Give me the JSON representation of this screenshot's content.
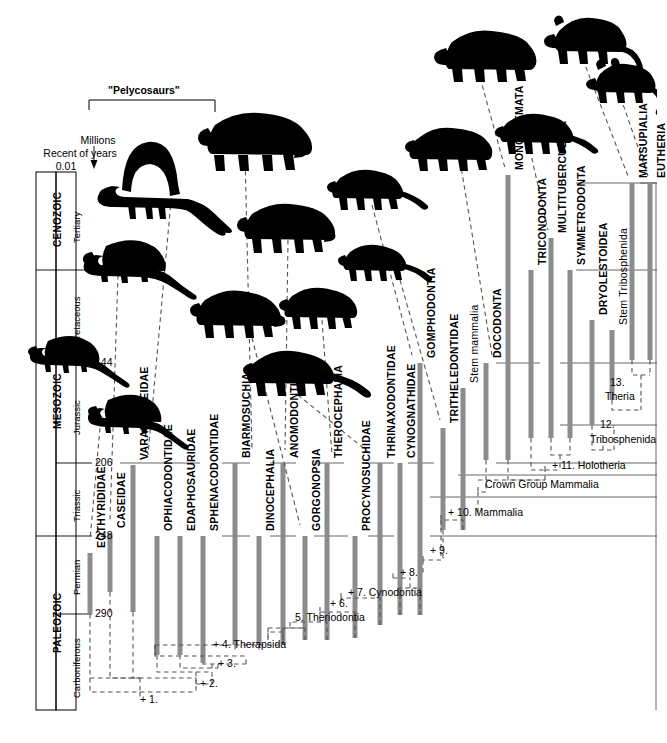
{
  "figure": {
    "title_overlay": "\"Pelycosaurs\"",
    "axis_caption_line1": "Millions",
    "axis_caption_line2": "of years",
    "recent_label": "Recent",
    "recent_value": "0.01"
  },
  "timescale": {
    "ticks": [
      {
        "value": "0.01",
        "y": 172
      },
      {
        "value": "65",
        "y": 270
      },
      {
        "value": "144",
        "y": 363
      },
      {
        "value": "206",
        "y": 463
      },
      {
        "value": "248",
        "y": 536
      },
      {
        "value": "290",
        "y": 614
      }
    ],
    "eras": [
      {
        "name": "CENOZOIC",
        "top": 172,
        "bottom": 270
      },
      {
        "name": "MESOZOIC",
        "top": 270,
        "bottom": 536
      },
      {
        "name": "PALEOZOIC",
        "top": 536,
        "bottom": 710
      }
    ],
    "periods": [
      {
        "name": "Tertiary",
        "top": 172,
        "bottom": 270
      },
      {
        "name": "Cretaceous",
        "top": 270,
        "bottom": 363
      },
      {
        "name": "Jurassic",
        "top": 363,
        "bottom": 463
      },
      {
        "name": "Triassic",
        "top": 463,
        "bottom": 536
      },
      {
        "name": "Permian",
        "top": 536,
        "bottom": 614
      },
      {
        "name": "Carboniferous",
        "top": 614,
        "bottom": 710
      }
    ]
  },
  "taxa": [
    {
      "label": "EOTHYRIDIDAE",
      "x": 90,
      "top": 553,
      "bottom": 614,
      "label_y": 548,
      "bold": true
    },
    {
      "label": "CASEIDAE",
      "x": 110,
      "top": 533,
      "bottom": 592,
      "label_y": 528,
      "bold": true
    },
    {
      "label": "VARANOPSEIDAE",
      "x": 133,
      "top": 465,
      "bottom": 612,
      "label_y": 460,
      "bold": true
    },
    {
      "label": "OPHIACODONTIDAE",
      "x": 157,
      "top": 536,
      "bottom": 655,
      "label_y": 531,
      "bold": true
    },
    {
      "label": "EDAPHOSAURIDAE",
      "x": 180,
      "top": 536,
      "bottom": 655,
      "label_y": 531,
      "bold": true
    },
    {
      "label": "SPHENACODONTIDAE",
      "x": 203,
      "top": 536,
      "bottom": 663,
      "label_y": 531,
      "bold": true
    },
    {
      "label": "BIARMOSUCHIA",
      "x": 235,
      "top": 463,
      "bottom": 645,
      "label_y": 458,
      "bold": true
    },
    {
      "label": "DINOCEPHALIA",
      "x": 259,
      "top": 536,
      "bottom": 645,
      "label_y": 531,
      "bold": true
    },
    {
      "label": "ANOMODONTIA",
      "x": 283,
      "top": 463,
      "bottom": 645,
      "label_y": 458,
      "bold": true
    },
    {
      "label": "GORGONOPSIA",
      "x": 305,
      "top": 536,
      "bottom": 640,
      "label_y": 531,
      "bold": true
    },
    {
      "label": "THEROCEPHALIA",
      "x": 327,
      "top": 463,
      "bottom": 640,
      "label_y": 458,
      "bold": true
    },
    {
      "label": "PROCYNOSUCHIDAE",
      "x": 355,
      "top": 536,
      "bottom": 638,
      "label_y": 531,
      "bold": true
    },
    {
      "label": "THRINAXODONTIDAE",
      "x": 380,
      "top": 463,
      "bottom": 625,
      "label_y": 458,
      "bold": true
    },
    {
      "label": "CYNOGNATHIDAE",
      "x": 400,
      "top": 463,
      "bottom": 615,
      "label_y": 458,
      "bold": true
    },
    {
      "label": "GOMPHODONTIA",
      "x": 420,
      "top": 363,
      "bottom": 615,
      "label_y": 358,
      "bold": true
    },
    {
      "label": "TRITHELEDONTIDAE",
      "x": 443,
      "top": 428,
      "bottom": 530,
      "label_y": 423,
      "bold": true
    },
    {
      "label": "Stem mammalia",
      "x": 463,
      "top": 388,
      "bottom": 530,
      "label_y": 383,
      "bold": false
    },
    {
      "label": "DOCODONTA",
      "x": 486,
      "top": 363,
      "bottom": 460,
      "label_y": 358,
      "bold": true
    },
    {
      "label": "MONOTREMATA",
      "x": 508,
      "top": 175,
      "bottom": 460,
      "label_y": 170,
      "bold": true
    },
    {
      "label": "TRICONODONTA",
      "x": 531,
      "top": 270,
      "bottom": 438,
      "label_y": 265,
      "bold": true
    },
    {
      "label": "MULTITUBERCULATA",
      "x": 551,
      "top": 238,
      "bottom": 438,
      "label_y": 233,
      "bold": true
    },
    {
      "label": "SYMMETRODONTA",
      "x": 570,
      "top": 270,
      "bottom": 438,
      "label_y": 265,
      "bold": true
    },
    {
      "label": "DRYOLESTOIDEA",
      "x": 592,
      "top": 320,
      "bottom": 425,
      "label_y": 315,
      "bold": true
    },
    {
      "label": "Stem Tribosphenida",
      "x": 612,
      "top": 330,
      "bottom": 400,
      "label_y": 325,
      "bold": false
    },
    {
      "label": "MARSUPIALIA",
      "x": 632,
      "top": 183,
      "bottom": 360,
      "label_y": 178,
      "bold": true
    },
    {
      "label": "EUTHERIA",
      "x": 650,
      "top": 183,
      "bottom": 360,
      "label_y": 178,
      "bold": true
    }
  ],
  "nodes": [
    {
      "label": "+ 1.",
      "x": 140,
      "y": 700
    },
    {
      "label": "+ 2.",
      "x": 200,
      "y": 684
    },
    {
      "label": "+ 3.",
      "x": 218,
      "y": 664
    },
    {
      "label": "+  4. Therapsida",
      "x": 213,
      "y": 645
    },
    {
      "label": "5. Theriodontia",
      "x": 295,
      "y": 618
    },
    {
      "label": "+ 6.",
      "x": 330,
      "y": 604
    },
    {
      "label": "+ 7. Cynodontia",
      "x": 348,
      "y": 593
    },
    {
      "label": "+ 8.",
      "x": 400,
      "y": 573
    },
    {
      "label": "+ 9.",
      "x": 430,
      "y": 551
    },
    {
      "label": "+ 10. Mammalia",
      "x": 448,
      "y": 513
    },
    {
      "label": "Crown Group Mammalia",
      "x": 485,
      "y": 485
    },
    {
      "label": "+ 11. Holotheria",
      "x": 552,
      "y": 466
    },
    {
      "label": "12.",
      "x": 600,
      "y": 425
    },
    {
      "label": "Tribosphenida",
      "x": 590,
      "y": 440
    },
    {
      "label": "13.",
      "x": 610,
      "y": 383
    },
    {
      "label": "Theria",
      "x": 605,
      "y": 397
    }
  ],
  "colors": {
    "bar": "#8c8c8c",
    "scale_band": "#d4d4d4",
    "line": "#000000",
    "dashed": "#555555",
    "silhouette": "#000000"
  },
  "silhouettes": [
    {
      "name": "edaphosaurus-silhouette",
      "x": 120,
      "y": 145
    },
    {
      "name": "ophiacodon-silhouette",
      "x": 88,
      "y": 230
    },
    {
      "name": "dimetrodon-like-silhouette",
      "x": 30,
      "y": 330
    },
    {
      "name": "varanops-silhouette",
      "x": 90,
      "y": 385
    },
    {
      "name": "dinocephalian-silhouette",
      "x": 205,
      "y": 110
    },
    {
      "name": "anomodont-silhouette",
      "x": 245,
      "y": 195
    },
    {
      "name": "gorgonopsian-silhouette",
      "x": 195,
      "y": 290
    },
    {
      "name": "therocephalian-silhouette",
      "x": 283,
      "y": 285
    },
    {
      "name": "cynodont-silhouette",
      "x": 250,
      "y": 350
    },
    {
      "name": "tritylodont-silhouette",
      "x": 335,
      "y": 165
    },
    {
      "name": "morganucodon-silhouette",
      "x": 345,
      "y": 240
    },
    {
      "name": "docodont-silhouette",
      "x": 415,
      "y": 125
    },
    {
      "name": "monotreme-silhouette",
      "x": 440,
      "y": 25
    },
    {
      "name": "multituberculate-silhouette",
      "x": 500,
      "y": 110
    },
    {
      "name": "marsupial-silhouette",
      "x": 550,
      "y": 10
    },
    {
      "name": "eutherian-silhouette",
      "x": 595,
      "y": 55
    }
  ]
}
